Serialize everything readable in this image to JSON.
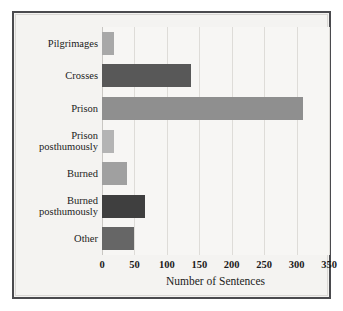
{
  "chart_data": {
    "type": "bar",
    "orientation": "horizontal",
    "title": "",
    "subtitle": "",
    "xlabel": "Number of Sentences",
    "ylabel": "",
    "categories": [
      "Pilgrimages",
      "Crosses",
      "Prison",
      "Prison posthumously",
      "Burned",
      "Burned posthumously",
      "Other"
    ],
    "category_labels_display": [
      "Pilgrimages",
      "Crosses",
      "Prison",
      "Prison\nposthumously",
      "Burned",
      "Burned\nposthumously",
      "Other"
    ],
    "values": [
      18,
      137,
      310,
      18,
      39,
      67,
      49
    ],
    "bar_colors": [
      "#a8a8a8",
      "#585858",
      "#8f8f8f",
      "#b4b4b4",
      "#a0a0a0",
      "#3f3f3f",
      "#666666"
    ],
    "xlim": [
      0,
      350
    ],
    "xticks": [
      0,
      50,
      100,
      150,
      200,
      250,
      300,
      350
    ],
    "xtick_labels": [
      "0",
      "50",
      "100",
      "150",
      "200",
      "250",
      "300",
      "350"
    ],
    "grid": true,
    "grid_axis": "x",
    "legend": null,
    "legend_position": "none",
    "annotations": [],
    "background_color": "#f7f6f4",
    "frame_color": "#4a4a4e",
    "text_color": "#1b1b1b"
  }
}
